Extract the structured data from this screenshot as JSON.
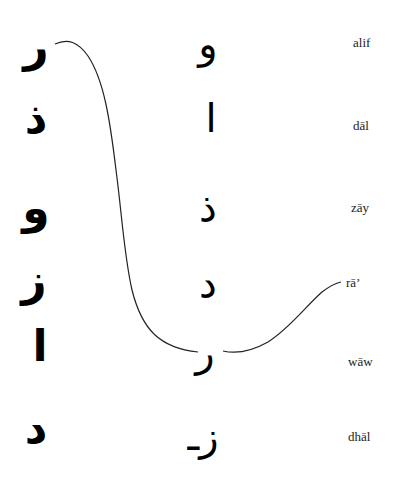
{
  "exercise": {
    "left_column": [
      {
        "char": "ر",
        "x": 36,
        "y": 46
      },
      {
        "char": "ذ",
        "x": 36,
        "y": 118
      },
      {
        "char": "و",
        "x": 36,
        "y": 208
      },
      {
        "char": "ز",
        "x": 34,
        "y": 280
      },
      {
        "char": "ا",
        "x": 40,
        "y": 346
      },
      {
        "char": "د",
        "x": 36,
        "y": 428
      }
    ],
    "middle_column": [
      {
        "char": "و",
        "x": 208,
        "y": 44
      },
      {
        "char": "ا",
        "x": 211,
        "y": 118
      },
      {
        "char": "ذ",
        "x": 208,
        "y": 208
      },
      {
        "char": "د",
        "x": 208,
        "y": 284
      },
      {
        "char": "ر",
        "x": 205,
        "y": 352
      },
      {
        "char": "زـ",
        "x": 203,
        "y": 436
      }
    ],
    "labels": [
      {
        "text": "alif",
        "x": 353,
        "y": 43
      },
      {
        "text": "dāl",
        "x": 353,
        "y": 126
      },
      {
        "text": "zāy",
        "x": 351,
        "y": 208
      },
      {
        "text": "rā’",
        "x": 346,
        "y": 283
      },
      {
        "text": "wāw",
        "x": 348,
        "y": 362
      },
      {
        "text": "dhāl",
        "x": 348,
        "y": 437
      }
    ],
    "connectors": [
      {
        "from": "left_column.0 (ر)",
        "to": "middle_column.4 (ر)"
      },
      {
        "from": "middle_column.4 (ر)",
        "to": "labels.3 (rā’)"
      }
    ],
    "line_color": "#222222"
  }
}
